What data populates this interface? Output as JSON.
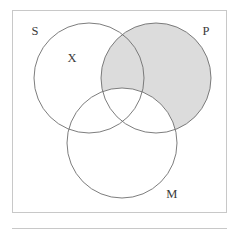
{
  "figure": {
    "kind": "venn-diagram-three-circle",
    "caption_rule_present": true,
    "frame": {
      "x": 12,
      "y": 10,
      "width": 215,
      "height": 203,
      "border_color": "#c8c8c8",
      "fill_color": "#ffffff"
    },
    "rule": {
      "x1": 12,
      "x2": 227,
      "y": 228,
      "color": "#c8c8c8"
    },
    "colors": {
      "outline": "#6e6e6e",
      "shading": "#dcdcdc",
      "label_text": "#3a3a3a",
      "background": "#ffffff"
    },
    "circles": [
      {
        "id": "S",
        "label": "S",
        "cx": 89,
        "cy": 78,
        "r": 55,
        "label_x": 35,
        "label_y": 32
      },
      {
        "id": "P",
        "label": "P",
        "cx": 156,
        "cy": 78,
        "r": 55,
        "label_x": 206,
        "label_y": 32
      },
      {
        "id": "M",
        "label": "M",
        "cx": 122,
        "cy": 143,
        "r": 55,
        "label_x": 172,
        "label_y": 195
      }
    ],
    "marks": [
      {
        "id": "X",
        "symbol": "X",
        "x": 72,
        "y": 59,
        "region": "S only"
      }
    ],
    "shaded_regions": [
      {
        "id": "P-minus-M",
        "description": "P excluding M",
        "color": "#dcdcdc"
      }
    ]
  }
}
